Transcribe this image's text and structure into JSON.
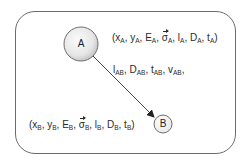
{
  "diagram": {
    "type": "node-edge",
    "nodes": [
      {
        "id": "A",
        "label": "A",
        "attributes_label": "(xA, yA, EA, σA, lA, DA, tA)",
        "attributes": [
          {
            "base": "x",
            "sub": "A"
          },
          {
            "base": "y",
            "sub": "A"
          },
          {
            "base": "E",
            "sub": "A"
          },
          {
            "base": "σ",
            "sub": "A",
            "vector": true
          },
          {
            "base": "l",
            "sub": "A"
          },
          {
            "base": "D",
            "sub": "A"
          },
          {
            "base": "t",
            "sub": "A"
          }
        ]
      },
      {
        "id": "B",
        "label": "B",
        "attributes_label": "(xB, yB, EB, σB, lB, DB, tB)",
        "attributes": [
          {
            "base": "x",
            "sub": "B"
          },
          {
            "base": "y",
            "sub": "B"
          },
          {
            "base": "E",
            "sub": "B"
          },
          {
            "base": "σ",
            "sub": "B",
            "vector": true
          },
          {
            "base": "l",
            "sub": "B"
          },
          {
            "base": "D",
            "sub": "B"
          },
          {
            "base": "t",
            "sub": "B"
          }
        ]
      }
    ],
    "edges": [
      {
        "from": "A",
        "to": "B",
        "directed": true,
        "label": "lAB, DAB, tAB, vAB,",
        "attributes": [
          {
            "base": "l",
            "sub": "AB"
          },
          {
            "base": "D",
            "sub": "AB"
          },
          {
            "base": "t",
            "sub": "AB"
          },
          {
            "base": "v",
            "sub": "AB"
          }
        ]
      }
    ]
  },
  "text": {
    "node_a": "A",
    "node_b": "B",
    "open": "(",
    "close": ")",
    "sep": ", ",
    "a_attrs": {
      "x": "x",
      "y": "y",
      "E": "E",
      "sigma": "σ",
      "l": "l",
      "D": "D",
      "t": "t",
      "sub": "A"
    },
    "b_attrs": {
      "x": "x",
      "y": "y",
      "E": "E",
      "sigma": "σ",
      "l": "l",
      "D": "D",
      "t": "t",
      "sub": "B"
    },
    "edge_attrs": {
      "l": "l",
      "D": "D",
      "t": "t",
      "v": "v",
      "sub": "AB",
      "trail": ","
    }
  },
  "colors": {
    "frame": "#6b6b6b",
    "node_fill_light": "#f4f4f4",
    "node_fill_dark": "#cfcfcf",
    "node_stroke": "#6e6e6e",
    "edge": "#333333",
    "text": "#2a2a2a"
  }
}
